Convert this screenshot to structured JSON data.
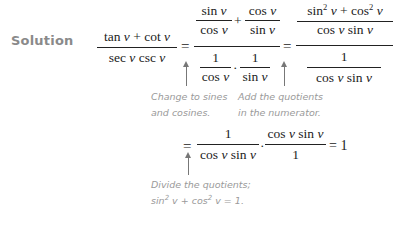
{
  "label": "Solution",
  "line1": {
    "lhs": {
      "numerator": "tan v + cot v",
      "denominator": "sec v csc v"
    },
    "step1": {
      "numerator": {
        "term1": {
          "num": "sin v",
          "den": "cos v"
        },
        "op": "+",
        "term2": {
          "num": "cos v",
          "den": "sin v"
        }
      },
      "denominator": {
        "term1": {
          "num": "1",
          "den": "cos v"
        },
        "op": "·",
        "term2": {
          "num": "1",
          "den": "sin v"
        }
      }
    },
    "step2": {
      "numerator": {
        "num": "sin² v + cos² v",
        "den": "cos v sin v"
      },
      "denominator": {
        "num": "1",
        "den": "cos v sin v"
      }
    },
    "equals": "="
  },
  "line2": {
    "equals": "=",
    "term1": {
      "num": "1",
      "den": "cos v sin v"
    },
    "op": "·",
    "term2": {
      "num": "cos v sin v",
      "den": "1"
    },
    "result": "= 1"
  },
  "annotations": [
    {
      "line1": "Change to sines",
      "line2": "and cosines."
    },
    {
      "line1": "Add the quotients",
      "line2": "in the numerator."
    },
    {
      "line1": "Divide the quotients;",
      "line2": "sin² v + cos² v = 1."
    }
  ]
}
